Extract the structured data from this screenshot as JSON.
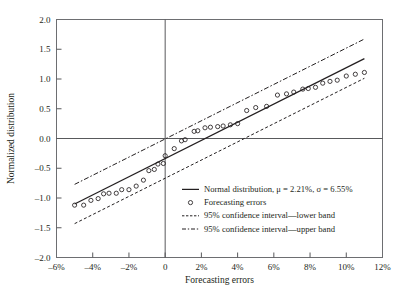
{
  "chart_data": {
    "type": "scatter",
    "title": "",
    "xlabel": "Forecasting errors",
    "ylabel": "Normalized distribution",
    "xlim": [
      -6,
      12
    ],
    "ylim": [
      -2.0,
      2.0
    ],
    "grid": false,
    "legend_position": "center-right-inside",
    "x_tick_labels": [
      "–6%",
      "–4%",
      "–2%",
      "0",
      "2%",
      "4%",
      "6%",
      "8%",
      "10%",
      "12%"
    ],
    "x_tick_values": [
      -6,
      -4,
      -2,
      0,
      2,
      4,
      6,
      8,
      10,
      12
    ],
    "y_tick_labels": [
      "–2.0",
      "–1.5",
      "–1.0",
      "–0.5",
      "0.0",
      "0.5",
      "1.0",
      "1.5",
      "2.0"
    ],
    "y_tick_values": [
      -2.0,
      -1.5,
      -1.0,
      -0.5,
      0.0,
      0.5,
      1.0,
      1.5,
      2.0
    ],
    "parameters": {
      "mu_percent": 2.21,
      "sigma_percent": 6.55,
      "confidence_level_percent": 95,
      "band_offset": 0.33
    },
    "series": [
      {
        "name": "Normal distribution, μ = 2.21%, σ = 6.55%",
        "type": "line",
        "style": "solid",
        "x": [
          -5.0,
          11.0
        ],
        "values": [
          -1.101,
          1.342
        ]
      },
      {
        "name": "95% confidence interval—lower band",
        "type": "line",
        "style": "dashed-fine",
        "x": [
          -5.0,
          11.0
        ],
        "values": [
          -1.431,
          1.012
        ]
      },
      {
        "name": "95% confidence interval—upper band",
        "type": "line",
        "style": "dash-dot",
        "x": [
          -5.0,
          11.0
        ],
        "values": [
          -0.771,
          1.672
        ]
      },
      {
        "name": "Forecasting errors",
        "type": "scatter",
        "marker": "open-circle",
        "points": [
          [
            -5.0,
            -1.12
          ],
          [
            -4.5,
            -1.12
          ],
          [
            -4.1,
            -1.04
          ],
          [
            -3.7,
            -1.01
          ],
          [
            -3.4,
            -0.93
          ],
          [
            -3.1,
            -0.92
          ],
          [
            -2.7,
            -0.92
          ],
          [
            -2.4,
            -0.86
          ],
          [
            -2.0,
            -0.86
          ],
          [
            -1.6,
            -0.8
          ],
          [
            -1.2,
            -0.7
          ],
          [
            -0.9,
            -0.54
          ],
          [
            -0.6,
            -0.52
          ],
          [
            -0.4,
            -0.43
          ],
          [
            -0.1,
            -0.42
          ],
          [
            0.0,
            -0.29
          ],
          [
            0.5,
            -0.17
          ],
          [
            0.9,
            -0.04
          ],
          [
            1.1,
            -0.02
          ],
          [
            1.6,
            0.12
          ],
          [
            1.8,
            0.13
          ],
          [
            2.2,
            0.18
          ],
          [
            2.5,
            0.19
          ],
          [
            2.9,
            0.2
          ],
          [
            3.2,
            0.21
          ],
          [
            3.6,
            0.23
          ],
          [
            4.0,
            0.25
          ],
          [
            4.5,
            0.47
          ],
          [
            5.0,
            0.52
          ],
          [
            5.6,
            0.54
          ],
          [
            6.2,
            0.73
          ],
          [
            6.7,
            0.75
          ],
          [
            7.1,
            0.78
          ],
          [
            7.6,
            0.83
          ],
          [
            7.9,
            0.84
          ],
          [
            8.3,
            0.86
          ],
          [
            8.7,
            0.93
          ],
          [
            9.1,
            0.96
          ],
          [
            9.5,
            0.98
          ],
          [
            10.0,
            1.05
          ],
          [
            10.5,
            1.08
          ],
          [
            11.0,
            1.11
          ]
        ]
      }
    ]
  },
  "legend": {
    "entries": [
      {
        "label": "Normal distribution, μ = 2.21%, σ = 6.55%",
        "marker": "solid-line"
      },
      {
        "label": "Forecasting errors",
        "marker": "open-circle"
      },
      {
        "label": "95% confidence interval—lower band",
        "marker": "dashed-fine-line"
      },
      {
        "label": "95% confidence interval—upper band",
        "marker": "dash-dot-line"
      }
    ]
  },
  "colors": {
    "ink": "#231f20",
    "axis": "#58595b",
    "background": "#ffffff"
  }
}
